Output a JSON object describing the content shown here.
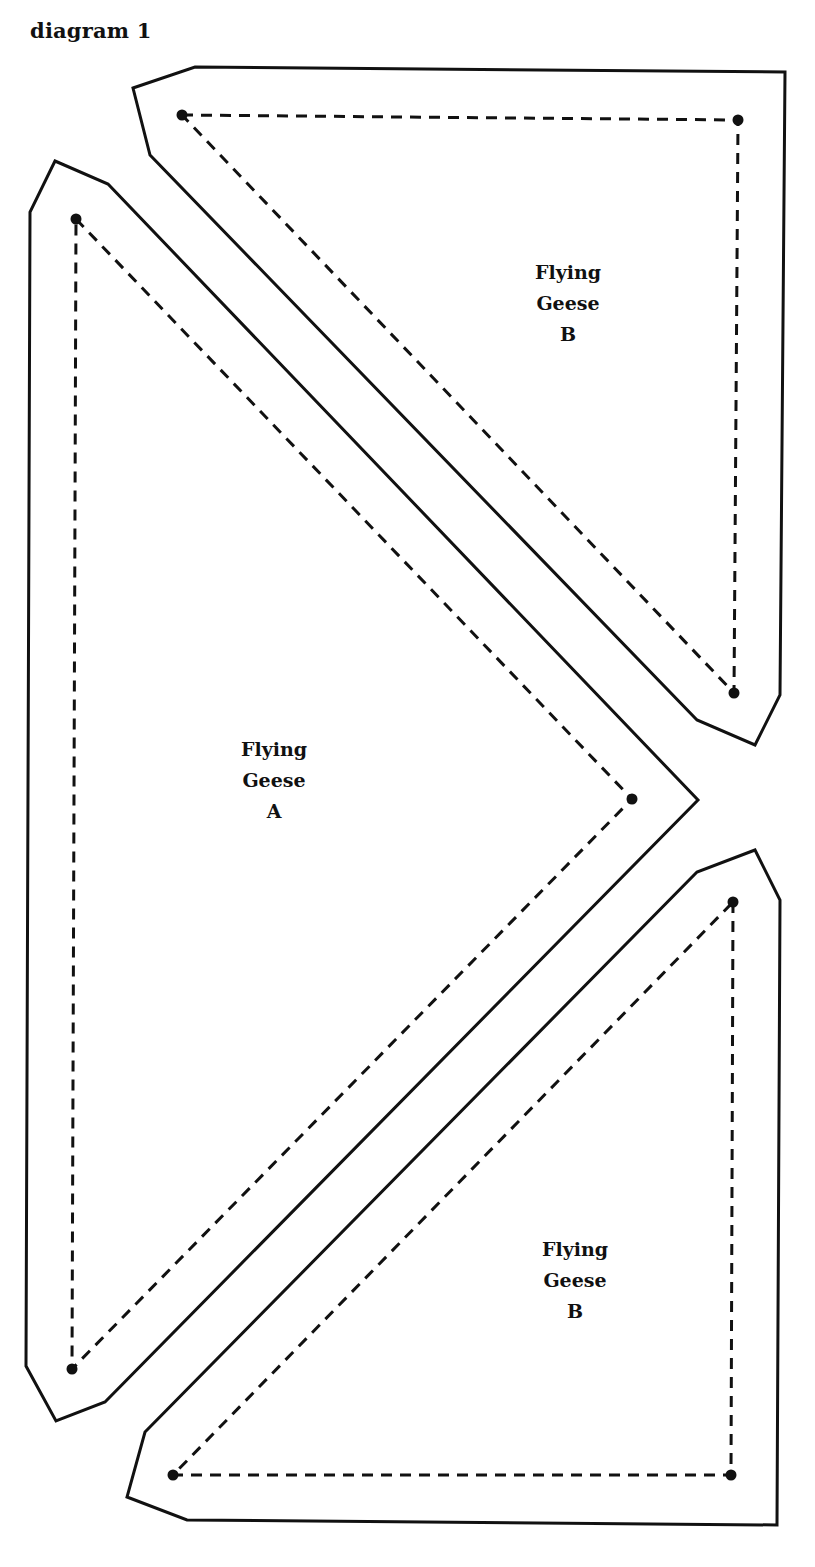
{
  "title": "diagram 1",
  "colors": {
    "line": "#111111",
    "background": "#ffffff"
  },
  "pieces": [
    {
      "id": "flying-geese-b-top",
      "label_lines": [
        "Flying",
        "Geese",
        "B"
      ],
      "outline": "133,88 195,67 785,72 780,695 755,745 697,720 150,155",
      "seam": "182,115 738,120 734,693 182,115",
      "dots": [
        [
          182,
          115
        ],
        [
          738,
          120
        ],
        [
          734,
          693
        ]
      ]
    },
    {
      "id": "flying-geese-a",
      "label_lines": [
        "Flying",
        "Geese",
        "A"
      ],
      "outline": "55,161 108,184 698,800 105,1402 56,1421 26,1366 30,212",
      "seam": "76,219 632,799 72,1369 76,219",
      "dots": [
        [
          76,
          219
        ],
        [
          632,
          799
        ],
        [
          72,
          1369
        ]
      ]
    },
    {
      "id": "flying-geese-b-bottom",
      "label_lines": [
        "Flying",
        "Geese",
        "B"
      ],
      "outline": "145,1432 697,872 755,850 780,900 777,1525 187,1520 127,1497",
      "seam": "733,902 731,1475 173,1475 733,902",
      "dots": [
        [
          733,
          902
        ],
        [
          731,
          1475
        ],
        [
          173,
          1475
        ]
      ]
    }
  ]
}
